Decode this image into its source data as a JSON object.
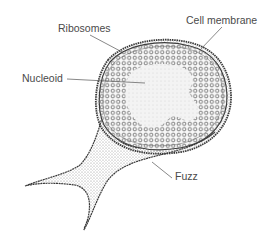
{
  "diagram": {
    "labels": {
      "ribosomes": "Ribosomes",
      "cell_membrane": "Cell membrane",
      "nucleoid": "Nucleoid",
      "fuzz": "Fuzz"
    },
    "colors": {
      "background": "#ffffff",
      "outline": "#3a3a3a",
      "stipple": "#8a8a8a",
      "nucleoid_fill": "#f2f2f2",
      "ribosome": "#6a6a6a",
      "label_text": "#4a4a4a"
    }
  }
}
